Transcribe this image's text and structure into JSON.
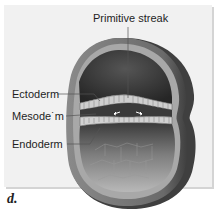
{
  "figure": {
    "panel_letter": "d.",
    "labels": {
      "primitive_streak": "Primitive streak",
      "ectoderm": "Ectoderm",
      "mesoderm": "Mesode˙m",
      "endoderm": "Endoderm"
    },
    "colors": {
      "panel_bg": "#f1f1f1",
      "wall_outer": "#6e6e6e",
      "wall_inner": "#a9a9a9",
      "cavity_top": "#3c3c3c",
      "cavity_bottom": "#8a8a8a",
      "disc": "#c9c9c9",
      "leader_line": "#555555"
    }
  }
}
